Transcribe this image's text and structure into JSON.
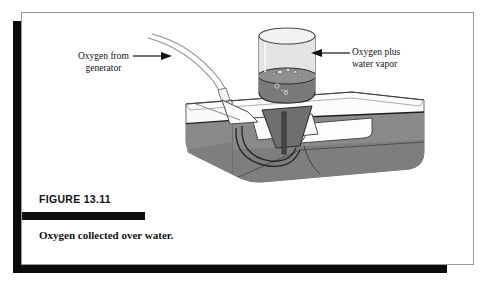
{
  "figure": {
    "heading": "FIGURE 13.11",
    "caption": "Oxygen collected over water.",
    "labels": {
      "left_line1": "Oxygen from",
      "left_line2": "generator",
      "right_line1": "Oxygen plus",
      "right_line2": "water vapor"
    }
  },
  "colors": {
    "ink": "#111111",
    "frame": "#9a9a9a",
    "shadow": "#0a0a0a",
    "water": "#8a8a8a",
    "water_dark": "#6f6f6f",
    "water_light": "#a6a6a6",
    "glass": "#efefef",
    "gas": "#e4e4e4",
    "outline": "#3a3a3a",
    "white": "#ffffff"
  }
}
